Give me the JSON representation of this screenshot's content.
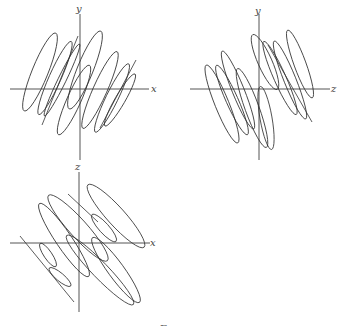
{
  "figure": {
    "panels": [
      {
        "name": "x-y projection",
        "horizontal_axis_label": "x",
        "vertical_axis_label": "y"
      },
      {
        "name": "z-y projection",
        "horizontal_axis_label": "z",
        "vertical_axis_label": "y"
      },
      {
        "name": "x-z projection",
        "horizontal_axis_label": "x",
        "vertical_axis_label": "z"
      }
    ],
    "caption_cut_off": "F"
  },
  "colors": {
    "axis": "#555555",
    "curve": "#333333",
    "background": "#ffffff"
  }
}
